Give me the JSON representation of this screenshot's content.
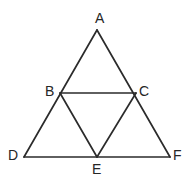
{
  "figure": {
    "background_color": "#ffffff",
    "line_color": "#2b2b2b",
    "label_color": "#262626",
    "canvas": {
      "width": 192,
      "height": 183
    }
  },
  "labels": {
    "a": "A",
    "b": "B",
    "c": "C",
    "d": "D",
    "e": "E",
    "f": "F"
  },
  "chart_data": {
    "type": "diagram",
    "points": [
      {
        "name": "A",
        "x": 97,
        "y": 30,
        "label_x": 95,
        "label_y": 11
      },
      {
        "name": "B",
        "x": 60,
        "y": 93,
        "label_x": 45,
        "label_y": 84
      },
      {
        "name": "C",
        "x": 136,
        "y": 93,
        "label_x": 139,
        "label_y": 84
      },
      {
        "name": "D",
        "x": 24,
        "y": 157,
        "label_x": 8,
        "label_y": 148
      },
      {
        "name": "E",
        "x": 97,
        "y": 157,
        "label_x": 92,
        "label_y": 162
      },
      {
        "name": "F",
        "x": 170,
        "y": 157,
        "label_x": 173,
        "label_y": 148
      }
    ],
    "segments": [
      {
        "name": "AD",
        "from": "A",
        "to": "D"
      },
      {
        "name": "AF",
        "from": "A",
        "to": "F"
      },
      {
        "name": "DF",
        "from": "D",
        "to": "F"
      },
      {
        "name": "BC",
        "from": "B",
        "to": "C"
      },
      {
        "name": "BE",
        "from": "B",
        "to": "E"
      },
      {
        "name": "CE",
        "from": "C",
        "to": "E"
      }
    ]
  }
}
